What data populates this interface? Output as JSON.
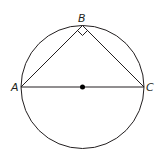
{
  "diagram": {
    "type": "geometry",
    "circle": {
      "cx": 82.5,
      "cy": 87,
      "r": 61.5,
      "stroke": "#231f20"
    },
    "center_point": {
      "x": 82.5,
      "y": 87,
      "color": "#000000"
    },
    "points": {
      "A": {
        "label": "A",
        "x": 21,
        "y": 87
      },
      "B": {
        "label": "B",
        "x": 82.5,
        "y": 25.5
      },
      "C": {
        "label": "C",
        "x": 144,
        "y": 87
      }
    },
    "segments": [
      "AB",
      "BC",
      "AC"
    ],
    "right_angle_at": "B"
  }
}
